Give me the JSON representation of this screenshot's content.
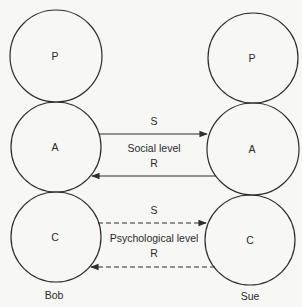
{
  "diagram": {
    "type": "transactional-analysis-ulterior-transaction",
    "colors": {
      "stroke": "#2e2e2e",
      "text": "#2a2a2a",
      "background": "#f7f7f5"
    },
    "persons": [
      {
        "name": "Bob",
        "states": [
          "P",
          "A",
          "C"
        ]
      },
      {
        "name": "Sue",
        "states": [
          "P",
          "A",
          "C"
        ]
      }
    ],
    "social": {
      "label": "Social level",
      "stimulus": "S",
      "response": "R",
      "line_style": "solid"
    },
    "psychological": {
      "label": "Psychological level",
      "stimulus": "S",
      "response": "R",
      "line_style": "dashed"
    }
  }
}
